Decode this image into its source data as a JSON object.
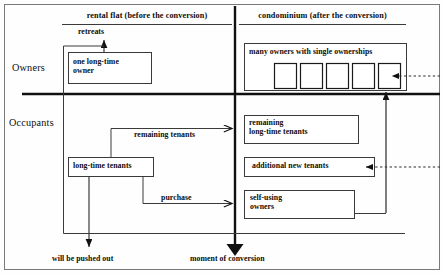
{
  "figure": {
    "title_left": "rental flat (before the conversion)",
    "title_right": "condominium (after the conversion)",
    "row_labels": {
      "owners": "Owners",
      "occupants": "Occupants"
    },
    "boxes": {
      "one_owner": "one long-time\nowner",
      "many_owners": "many owners with single ownerships",
      "long_time_tenants": "long-time tenants",
      "remaining_long_time_tenants": "remaining\nlong-time tenants",
      "additional_new_tenants": "additional new tenants",
      "self_using_owners": "self-using\nowners"
    },
    "edge_labels": {
      "retreats": "retreats",
      "remaining_tenants": "remaining tenants",
      "purchase": "purchase",
      "pushed_out": "will be pushed out",
      "moment_of_conversion": "moment of conversion"
    },
    "ownership_units": [
      "unit-1",
      "unit-2",
      "unit-3",
      "unit-4",
      "unit-5"
    ],
    "colors": {
      "ink": "#0d0d0d",
      "line": "#3a3a3a",
      "background": "#fefefe",
      "frame": "#7a7a7a"
    }
  }
}
